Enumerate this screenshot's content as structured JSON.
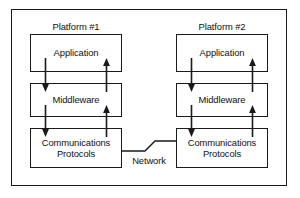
{
  "figure": {
    "stroke_color": "#1a1a1a",
    "text_color": "#111111",
    "background": "#ffffff"
  },
  "platforms": [
    {
      "label": "Platform #1",
      "layers": [
        {
          "name": "Application",
          "text": "Application"
        },
        {
          "name": "Middleware",
          "text": "Middleware"
        },
        {
          "name": "Communications Protocols",
          "text": "Communications\nProtocols"
        }
      ],
      "connectors": [
        {
          "from": "Application",
          "to": "Middleware",
          "direction": "down"
        },
        {
          "from": "Middleware",
          "to": "Application",
          "direction": "up"
        },
        {
          "from": "Middleware",
          "to": "Communications Protocols",
          "direction": "down"
        },
        {
          "from": "Communications Protocols",
          "to": "Middleware",
          "direction": "up"
        }
      ]
    },
    {
      "label": "Platform #2",
      "layers": [
        {
          "name": "Application",
          "text": "Application"
        },
        {
          "name": "Middleware",
          "text": "Middleware"
        },
        {
          "name": "Communications Protocols",
          "text": "Communications\nProtocols"
        }
      ],
      "connectors": [
        {
          "from": "Application",
          "to": "Middleware",
          "direction": "down"
        },
        {
          "from": "Middleware",
          "to": "Application",
          "direction": "up"
        },
        {
          "from": "Middleware",
          "to": "Communications Protocols",
          "direction": "down"
        },
        {
          "from": "Communications Protocols",
          "to": "Middleware",
          "direction": "up"
        }
      ]
    }
  ],
  "network": {
    "label": "Network",
    "connects": [
      "Platform #1 Communications Protocols",
      "Platform #2 Communications Protocols"
    ],
    "style": "zigzag"
  }
}
